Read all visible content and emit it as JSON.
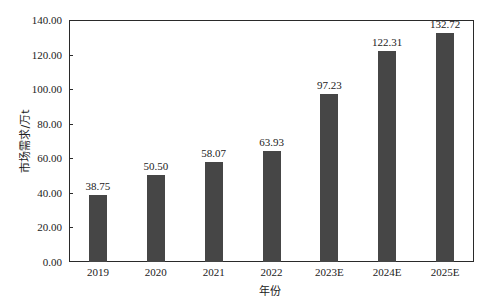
{
  "chart_data": {
    "type": "bar",
    "title": "",
    "xlabel": "年份",
    "ylabel": "市场需求/万t",
    "categories": [
      "2019",
      "2020",
      "2021",
      "2022",
      "2023E",
      "2024E",
      "2025E"
    ],
    "values": [
      38.75,
      50.5,
      58.07,
      63.93,
      97.23,
      122.31,
      132.72
    ],
    "value_labels": [
      "38.75",
      "50.50",
      "58.07",
      "63.93",
      "97.23",
      "122.31",
      "132.72"
    ],
    "ylim": [
      0,
      140
    ],
    "yticks": [
      "0.00",
      "20.00",
      "40.00",
      "60.00",
      "80.00",
      "100.00",
      "120.00",
      "140.00"
    ],
    "grid": false,
    "legend": null,
    "bar_color": "#464646"
  }
}
